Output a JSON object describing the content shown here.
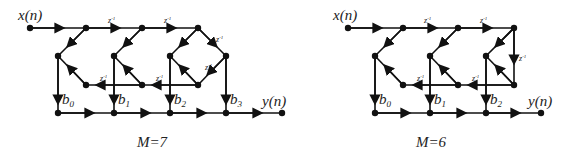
{
  "figures": [
    {
      "caption": "M=7",
      "input_label": "x(n)",
      "output_label": "y(n)",
      "coefficients": [
        "b",
        "b",
        "b",
        "b"
      ],
      "coefficient_subscripts": [
        "0",
        "1",
        "2",
        "3"
      ],
      "delay_label": "z",
      "delay_exp": "-1"
    },
    {
      "caption": "M=6",
      "input_label": "x(n)",
      "output_label": "y(n)",
      "coefficients": [
        "b",
        "b",
        "b"
      ],
      "coefficient_subscripts": [
        "0",
        "1",
        "2"
      ],
      "delay_label": "z",
      "delay_exp": "-1"
    }
  ]
}
